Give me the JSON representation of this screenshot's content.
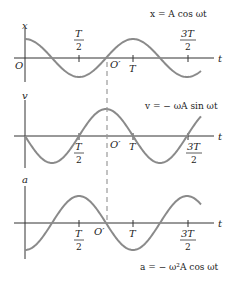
{
  "figure": {
    "panels": [
      {
        "id": "position",
        "axis_label": "x",
        "equation": "x = A cos ωt",
        "origin_label": "O",
        "shifted_origin_label": "O′",
        "time_label": "t",
        "ticks": [
          {
            "label_num": "T",
            "label_den": "2",
            "position": "above"
          },
          {
            "label": "T",
            "position": "below"
          },
          {
            "label_num": "3T",
            "label_den": "2",
            "position": "above"
          }
        ]
      },
      {
        "id": "velocity",
        "axis_label": "v",
        "equation": "v = − ωA sin ωt",
        "shifted_origin_label": "O′",
        "time_label": "t",
        "ticks": [
          {
            "label_num": "T",
            "label_den": "2",
            "position": "below"
          },
          {
            "label": "T",
            "position": "below"
          },
          {
            "label_num": "3T",
            "label_den": "2",
            "position": "below"
          }
        ]
      },
      {
        "id": "acceleration",
        "axis_label": "a",
        "equation": "a = − ω²A cos ωt",
        "shifted_origin_label": "O′",
        "time_label": "t",
        "ticks": [
          {
            "label_num": "T",
            "label_den": "2",
            "position": "below"
          },
          {
            "label": "T",
            "position": "below"
          },
          {
            "label_num": "3T",
            "label_den": "2",
            "position": "below"
          }
        ]
      }
    ],
    "colors": {
      "curve": "#8a8a8a",
      "axis": "#333333",
      "dashed": "#9a9a9a"
    }
  }
}
